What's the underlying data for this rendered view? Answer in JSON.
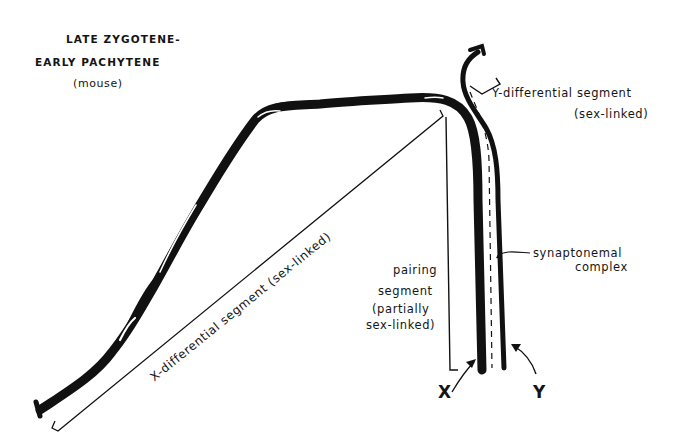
{
  "title": {
    "line1": "LATE ZYGOTENE-",
    "line2": "EARLY PACHYTENE",
    "line3": "(mouse)"
  },
  "labels": {
    "y_differential_line1": "Y-differential  segment",
    "y_differential_line2": "(sex-linked)",
    "x_differential": "X-differential  segment  (sex-linked)",
    "pairing_line1": "pairing",
    "pairing_line2": "segment",
    "pairing_line3": "(partially",
    "pairing_line4": "sex-linked)",
    "synaptonemal_line1": "synaptonemal",
    "synaptonemal_line2": "complex",
    "x_chromosome": "X",
    "y_chromosome": "Y"
  },
  "colors": {
    "ink": "#111111",
    "background": "#ffffff"
  }
}
